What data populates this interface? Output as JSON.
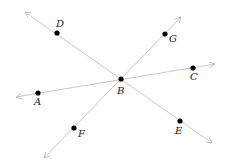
{
  "diagram": {
    "type": "geometry-lines",
    "line_color": "#c8c8c8",
    "point_color": "#000000",
    "lines": [
      {
        "name": "line-DE",
        "x1": 25,
        "y1": 12,
        "x2": 212,
        "y2": 143,
        "arrows": "both"
      },
      {
        "name": "line-AC",
        "x1": 16,
        "y1": 97,
        "x2": 215,
        "y2": 64,
        "arrows": "both"
      },
      {
        "name": "line-FG",
        "x1": 44,
        "y1": 158,
        "x2": 181,
        "y2": 17,
        "arrows": "both"
      }
    ],
    "points": [
      {
        "label": "B",
        "x": 121,
        "y": 79,
        "lx": 117,
        "ly": 94
      },
      {
        "label": "D",
        "x": 57,
        "y": 33,
        "lx": 56,
        "ly": 27
      },
      {
        "label": "G",
        "x": 165,
        "y": 34,
        "lx": 169,
        "ly": 42
      },
      {
        "label": "C",
        "x": 193,
        "y": 68,
        "lx": 190,
        "ly": 80
      },
      {
        "label": "A",
        "x": 38,
        "y": 93,
        "lx": 34,
        "ly": 105
      },
      {
        "label": "F",
        "x": 74,
        "y": 128,
        "lx": 78,
        "ly": 137
      },
      {
        "label": "E",
        "x": 180,
        "y": 121,
        "lx": 175,
        "ly": 134
      }
    ]
  }
}
